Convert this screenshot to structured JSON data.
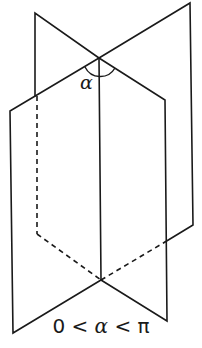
{
  "diagram": {
    "type": "dihedral-angle",
    "angle_label": "α",
    "caption": {
      "left": "0 <",
      "variable": "α",
      "right": "< π"
    },
    "colors": {
      "stroke": "#1a1a1a",
      "background": "#ffffff"
    }
  }
}
